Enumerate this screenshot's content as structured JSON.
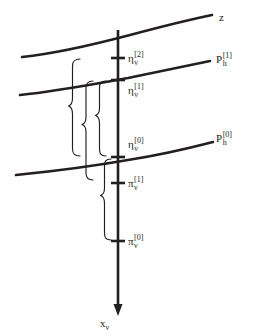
{
  "figure": {
    "background_color": "#ffffff",
    "ink_color": "#231f20",
    "curves": [
      {
        "name": "z",
        "label_base": "z",
        "label_sup": "",
        "label_sub": ""
      },
      {
        "name": "P_h_1",
        "label_base": "P",
        "label_sup": "[1]",
        "label_sub": "h"
      },
      {
        "name": "P_h_0",
        "label_base": "P",
        "label_sup": "[0]",
        "label_sub": "h"
      }
    ],
    "axis": {
      "name": "x_nu",
      "label_base": "x",
      "label_sub": "ν",
      "direction": "downward-arrow"
    },
    "ticks": [
      {
        "name": "eta_nu_2",
        "base": "η",
        "sub": "ν",
        "sup": "[2]"
      },
      {
        "name": "eta_nu_1",
        "base": "η",
        "sub": "ν",
        "sup": "[1]"
      },
      {
        "name": "eta_nu_0",
        "base": "η",
        "sub": "ν",
        "sup": "[0]"
      },
      {
        "name": "pi_nu_1",
        "base": "π",
        "sub": "ν",
        "sup": "[1]"
      },
      {
        "name": "pi_nu_0",
        "base": "π",
        "sub": "ν",
        "sup": "[0]"
      }
    ],
    "braces": [
      {
        "name": "brace-outer-eta2-eta0"
      },
      {
        "name": "brace-middle-eta1-pi1"
      },
      {
        "name": "brace-inner-eta1-eta0"
      },
      {
        "name": "brace-lower-eta0-pi0"
      }
    ]
  }
}
